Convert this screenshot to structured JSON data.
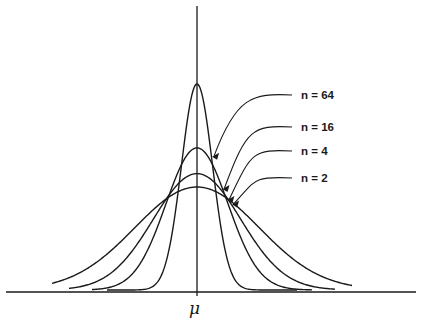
{
  "chart_data": {
    "type": "line",
    "title": "",
    "xlabel": "",
    "ylabel": "",
    "x_tick_labels": [
      "μ"
    ],
    "grid": false,
    "series": [
      {
        "name": "n = 2",
        "n": 2,
        "relative_sd": 1.0,
        "relative_peak": 1.0
      },
      {
        "name": "n = 4",
        "n": 4,
        "relative_sd": 0.707,
        "relative_peak": 1.13
      },
      {
        "name": "n = 16",
        "n": 16,
        "relative_sd": 0.5,
        "relative_peak": 1.38
      },
      {
        "name": "n = 64",
        "n": 64,
        "relative_sd": 0.25,
        "relative_peak": 2.0
      }
    ],
    "legend": "right, with leader arrows pointing to each curve"
  }
}
